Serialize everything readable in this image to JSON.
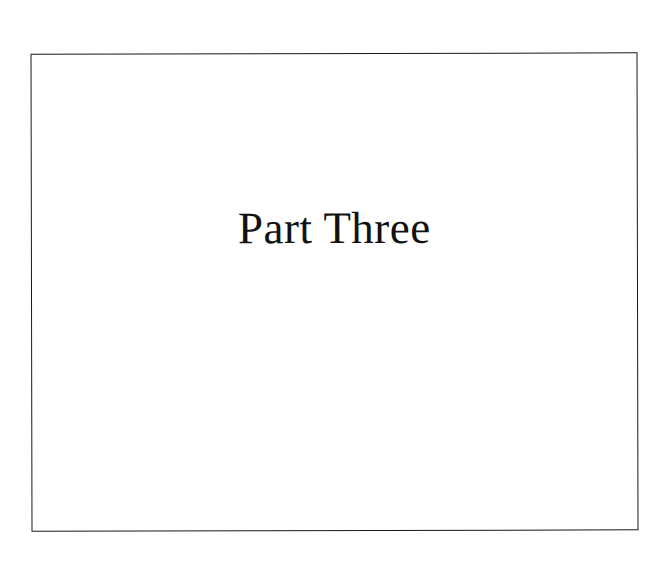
{
  "document": {
    "page_type": "part-title-page",
    "background_color": "#ffffff"
  },
  "frame": {
    "border_color": "#1a1a1a",
    "fill_color": "#ffffff"
  },
  "title": {
    "text": "Part Three",
    "color": "#121212"
  },
  "body": {
    "text": ""
  }
}
